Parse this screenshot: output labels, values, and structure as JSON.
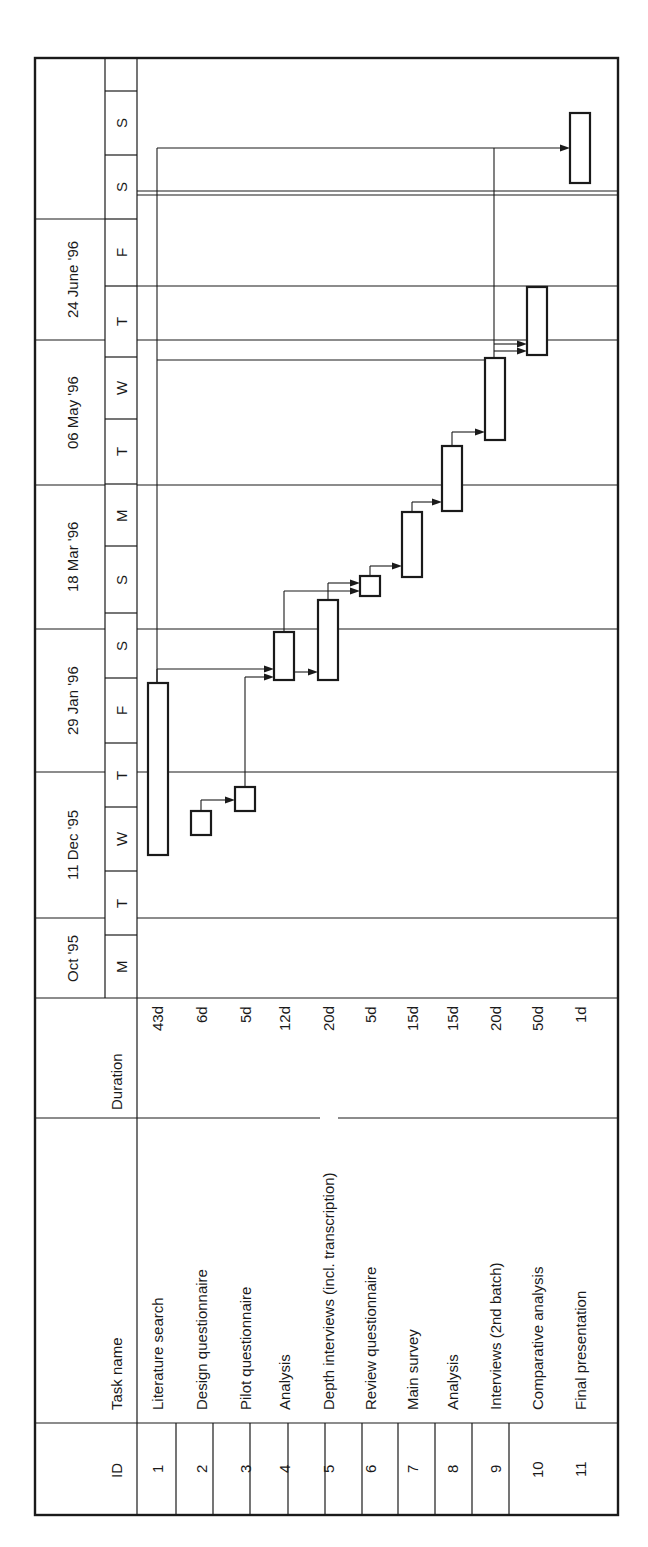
{
  "chart_data": {
    "type": "gantt",
    "orientation": "rotated-90-ccw",
    "columns": {
      "id": "ID",
      "task": "Task name",
      "duration": "Duration"
    },
    "timescale": {
      "major": [
        "Oct '95",
        "11 Dec '95",
        "29 Jan '96",
        "18 Mar '96",
        "06 May '96",
        "24 June '96",
        ""
      ],
      "minor": [
        "M",
        "T",
        "W",
        "T",
        "F",
        "S",
        "S",
        "M",
        "T",
        "W",
        "T",
        "F",
        "S",
        "S",
        ""
      ]
    },
    "tasks": [
      {
        "id": "1",
        "name": "Literature search",
        "duration": "43d"
      },
      {
        "id": "2",
        "name": "Design questionnaire",
        "duration": "6d"
      },
      {
        "id": "3",
        "name": "Pilot questionnaire",
        "duration": "5d"
      },
      {
        "id": "4",
        "name": "Analysis",
        "duration": "12d"
      },
      {
        "id": "5",
        "name": "Depth interviews (incl. transcription)",
        "duration": "20d"
      },
      {
        "id": "6",
        "name": "Review questionnaire",
        "duration": "5d"
      },
      {
        "id": "7",
        "name": "Main survey",
        "duration": "15d"
      },
      {
        "id": "8",
        "name": "Analysis",
        "duration": "15d"
      },
      {
        "id": "9",
        "name": "Interviews (2nd batch)",
        "duration": "20d"
      },
      {
        "id": "10",
        "name": "Comparative analysis",
        "duration": "50d"
      },
      {
        "id": "11",
        "name": "Final presentation",
        "duration": "1d"
      }
    ],
    "dependencies": [
      [
        1,
        4
      ],
      [
        3,
        4
      ],
      [
        2,
        3
      ],
      [
        4,
        5
      ],
      [
        4,
        6
      ],
      [
        5,
        6
      ],
      [
        6,
        7
      ],
      [
        7,
        8
      ],
      [
        8,
        9
      ],
      [
        1,
        9
      ],
      [
        9,
        10
      ],
      [
        1,
        10
      ],
      [
        1,
        11
      ]
    ],
    "legend": null,
    "grid": true
  },
  "style": {
    "line_color": "#1a1a1a",
    "background": "#ffffff"
  }
}
